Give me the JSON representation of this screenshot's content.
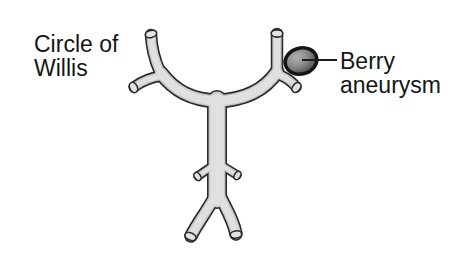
{
  "labels": {
    "circle_of_willis": "Circle of\nWillis",
    "berry_aneurysm": "Berry\naneurysm"
  },
  "colors": {
    "background": "#ffffff",
    "vessel-outline": "#2b2b2b",
    "vessel-shade": "#c9c9c9",
    "vessel-fill": "#e0e0e0",
    "cap-fill": "#e3e3e3",
    "aneurysm-outline": "#151515",
    "aneurysm-light": "#b0b0b0",
    "aneurysm-mid": "#8e8e8e",
    "aneurysm-dark": "#454545",
    "label-text": "#161616",
    "leader-line": "#1c1c1c"
  }
}
